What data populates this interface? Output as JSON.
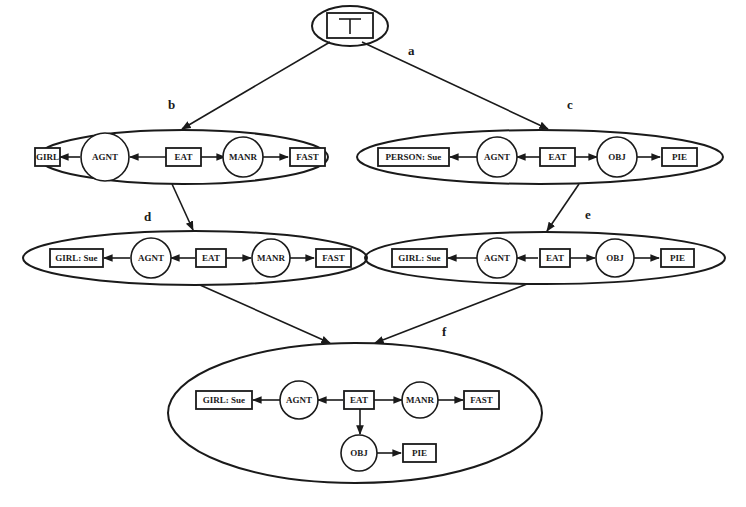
{
  "diagram": {
    "colors": {
      "ink": "#1a1a1a",
      "background": "#ffffff"
    },
    "top": {
      "tag": "a",
      "node": "⊤"
    },
    "graph_b": {
      "tag": "b",
      "nodes": {
        "n1": "GIRL",
        "r1": "AGNT",
        "n2": "EAT",
        "r2": "MANR",
        "n3": "FAST"
      }
    },
    "graph_c": {
      "tag": "c",
      "nodes": {
        "n1": "PERSON: Sue",
        "r1": "AGNT",
        "n2": "EAT",
        "r2": "OBJ",
        "n3": "PIE"
      }
    },
    "graph_d": {
      "tag": "d",
      "nodes": {
        "n1": "GIRL: Sue",
        "r1": "AGNT",
        "n2": "EAT",
        "r2": "MANR",
        "n3": "FAST"
      }
    },
    "graph_e": {
      "tag": "e",
      "nodes": {
        "n1": "GIRL: Sue",
        "r1": "AGNT",
        "n2": "EAT",
        "r2": "OBJ",
        "n3": "PIE"
      }
    },
    "graph_f": {
      "tag": "f",
      "nodes": {
        "n1": "GIRL: Sue",
        "r1": "AGNT",
        "n2": "EAT",
        "r2": "MANR",
        "n3": "FAST",
        "r3": "OBJ",
        "n4": "PIE"
      }
    }
  }
}
